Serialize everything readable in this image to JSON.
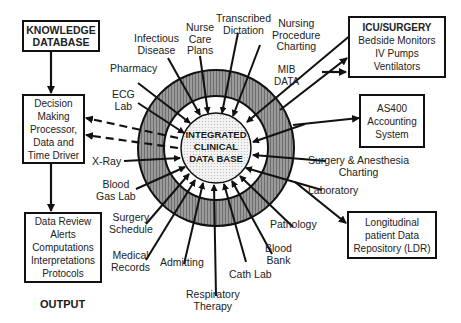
{
  "diagram": {
    "center": {
      "lines": [
        "INTEGRATED",
        "CLINICAL",
        "DATA BASE"
      ]
    },
    "left_boxes": {
      "knowledge": {
        "lines": [
          "KNOWLEDGE",
          "DATABASE"
        ]
      },
      "decision": {
        "lines": [
          "Decision",
          "Making",
          "Processor,",
          "Data and",
          "Time Driver"
        ]
      },
      "output_box": {
        "lines": [
          "Data Review",
          "Alerts",
          "Computations",
          "Interpretations",
          "Protocols"
        ]
      },
      "output_label": "OUTPUT"
    },
    "right_boxes": {
      "icu": {
        "title": "ICU/SURGERY",
        "lines": [
          "Bedside Monitors",
          "IV Pumps",
          "Ventilators"
        ]
      },
      "as400": {
        "lines": [
          "AS400",
          "Accounting",
          "System"
        ]
      },
      "ldr": {
        "lines": [
          "Longitudinal",
          "patient Data",
          "Repository (LDR)"
        ]
      }
    },
    "spokes": [
      {
        "lines": [
          "Infectious",
          "Disease"
        ]
      },
      {
        "lines": [
          "Nurse",
          "Care",
          "Plans"
        ]
      },
      {
        "lines": [
          "Transcribed",
          "Dictation"
        ]
      },
      {
        "lines": [
          "Nursing",
          "Procedure",
          "Charting"
        ]
      },
      {
        "lines": [
          "MIB",
          "DATA"
        ]
      },
      {
        "lines": [
          "Pharmacy"
        ]
      },
      {
        "lines": [
          "ECG",
          "Lab"
        ]
      },
      {
        "lines": [
          "X-Ray"
        ]
      },
      {
        "lines": [
          "Blood",
          "Gas Lab"
        ]
      },
      {
        "lines": [
          "Surgery",
          "Schedule"
        ]
      },
      {
        "lines": [
          "Medical",
          "Records"
        ]
      },
      {
        "lines": [
          "Admitting"
        ]
      },
      {
        "lines": [
          "Respiratory",
          "Therapy"
        ]
      },
      {
        "lines": [
          "Cath Lab"
        ]
      },
      {
        "lines": [
          "Blood",
          "Bank"
        ]
      },
      {
        "lines": [
          "Pathology"
        ]
      },
      {
        "lines": [
          "Laboratory"
        ]
      },
      {
        "lines": [
          "Surgery & Anesthesia",
          "Charting"
        ]
      }
    ],
    "colors": {
      "ring": "#8a8a8a",
      "line": "#111111",
      "center_fill": "#e6e6e6"
    }
  }
}
